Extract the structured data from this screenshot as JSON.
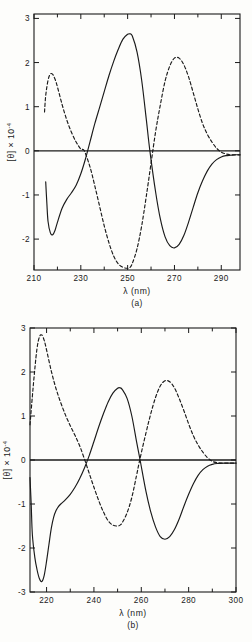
{
  "figure": {
    "panels": [
      {
        "id": "a",
        "caption": "(a)",
        "xlabel": "λ (nm)",
        "ylabel_main": "[θ] × 10",
        "ylabel_exp": "-4",
        "xticks": [
          "210",
          "230",
          "250",
          "270",
          "290"
        ],
        "yticks": [
          "3",
          "2",
          "1",
          "0",
          "-1",
          "-2"
        ]
      },
      {
        "id": "b",
        "caption": "(b)",
        "xlabel": "λ (nm)",
        "ylabel_main": "[θ] × 10",
        "ylabel_exp": "-4",
        "xticks": [
          "220",
          "240",
          "260",
          "280",
          "300"
        ],
        "yticks": [
          "3",
          "2",
          "1",
          "0",
          "-1",
          "-2",
          "-3"
        ]
      }
    ]
  },
  "chart_data": [
    {
      "type": "line",
      "title": "(a)",
      "xlabel": "λ (nm)",
      "ylabel": "[θ] × 10^-4",
      "xlim": [
        210,
        298
      ],
      "ylim": [
        -2.7,
        3.1
      ],
      "xticks": [
        210,
        230,
        250,
        270,
        290
      ],
      "yticks": [
        3,
        2,
        1,
        0,
        -1,
        -2
      ],
      "minor_tick_interval": 10,
      "grid": false,
      "legend": "none",
      "series": [
        {
          "name": "solid-curve",
          "style": "solid",
          "x": [
            215,
            215.5,
            216,
            217,
            218,
            219,
            220,
            222,
            224,
            226,
            228,
            230,
            232,
            234,
            236,
            238,
            240,
            242,
            244,
            246,
            248,
            250,
            251,
            252,
            254,
            256,
            258,
            259.5,
            262,
            264,
            266,
            268,
            270,
            272,
            274,
            276,
            278,
            280,
            282,
            284,
            286,
            288,
            290,
            292,
            294,
            296,
            298
          ],
          "y": [
            -0.7,
            -1.2,
            -1.6,
            -1.86,
            -1.9,
            -1.8,
            -1.62,
            -1.3,
            -1.1,
            -0.95,
            -0.78,
            -0.52,
            -0.18,
            0.22,
            0.62,
            0.98,
            1.34,
            1.7,
            2.02,
            2.3,
            2.53,
            2.64,
            2.65,
            2.6,
            2.24,
            1.6,
            0.7,
            0.0,
            -0.95,
            -1.55,
            -1.95,
            -2.15,
            -2.2,
            -2.12,
            -1.92,
            -1.62,
            -1.28,
            -0.95,
            -0.68,
            -0.46,
            -0.3,
            -0.2,
            -0.14,
            -0.11,
            -0.1,
            -0.09,
            -0.09
          ]
        },
        {
          "name": "dashed-curve",
          "style": "dashed",
          "x": [
            214.5,
            215,
            216,
            217,
            218,
            219,
            220,
            222,
            224,
            226,
            228,
            230,
            231.5,
            234,
            236,
            238,
            240,
            242,
            244,
            246,
            248,
            250,
            251,
            252,
            254,
            256,
            258,
            260,
            262,
            264,
            266,
            268,
            270,
            272,
            274,
            276,
            278,
            280,
            282,
            284,
            286,
            288,
            290,
            292,
            294,
            296,
            298
          ],
          "y": [
            0.88,
            1.25,
            1.6,
            1.74,
            1.73,
            1.62,
            1.45,
            1.05,
            0.7,
            0.42,
            0.2,
            0.04,
            0.0,
            -0.38,
            -0.8,
            -1.25,
            -1.7,
            -2.08,
            -2.38,
            -2.56,
            -2.64,
            -2.66,
            -2.64,
            -2.55,
            -2.22,
            -1.7,
            -1.02,
            -0.28,
            0.45,
            1.05,
            1.58,
            1.92,
            2.1,
            2.1,
            1.95,
            1.68,
            1.32,
            0.95,
            0.62,
            0.38,
            0.2,
            0.06,
            -0.03,
            -0.07,
            -0.09,
            -0.09,
            -0.09
          ]
        }
      ]
    },
    {
      "type": "line",
      "title": "(b)",
      "xlabel": "λ (nm)",
      "ylabel": "[θ] × 10^-4",
      "xlim": [
        213,
        300
      ],
      "ylim": [
        -3,
        3
      ],
      "xticks": [
        220,
        240,
        260,
        280,
        300
      ],
      "yticks": [
        3,
        2,
        1,
        0,
        -1,
        -2,
        -3
      ],
      "minor_tick_interval": 10,
      "grid": false,
      "legend": "none",
      "series": [
        {
          "name": "solid-curve",
          "style": "solid",
          "x": [
            213,
            213.5,
            214,
            215,
            216,
            217,
            218,
            219,
            220,
            221,
            222,
            223,
            224,
            225,
            226,
            228,
            230,
            232,
            234,
            236,
            238,
            240,
            242,
            244,
            246,
            248,
            250,
            251,
            252,
            254,
            256,
            258,
            259.5,
            262,
            264,
            266,
            268,
            270,
            272,
            274,
            276,
            278,
            280,
            282,
            284,
            286,
            288,
            290,
            292,
            295,
            298,
            300
          ],
          "y": [
            -0.4,
            -1.0,
            -1.7,
            -2.2,
            -2.5,
            -2.7,
            -2.76,
            -2.62,
            -2.3,
            -1.92,
            -1.55,
            -1.3,
            -1.15,
            -1.06,
            -1.0,
            -0.9,
            -0.78,
            -0.62,
            -0.42,
            -0.18,
            0.1,
            0.42,
            0.75,
            1.05,
            1.32,
            1.52,
            1.63,
            1.64,
            1.6,
            1.4,
            1.0,
            0.42,
            0.0,
            -0.72,
            -1.18,
            -1.52,
            -1.74,
            -1.8,
            -1.74,
            -1.58,
            -1.34,
            -1.05,
            -0.78,
            -0.54,
            -0.35,
            -0.22,
            -0.14,
            -0.1,
            -0.08,
            -0.07,
            -0.07,
            -0.07
          ]
        },
        {
          "name": "dashed-curve",
          "style": "dashed",
          "x": [
            213,
            214,
            215,
            216,
            217,
            218,
            219,
            220,
            222,
            224,
            226,
            228,
            230,
            232,
            234,
            236,
            238,
            240,
            242,
            244,
            246,
            248,
            250,
            251,
            252,
            254,
            256,
            258,
            259.5,
            262,
            264,
            266,
            268,
            270,
            272,
            274,
            276,
            278,
            280,
            282,
            284,
            286,
            288,
            290,
            292,
            295,
            298,
            300
          ],
          "y": [
            0.8,
            1.45,
            2.05,
            2.55,
            2.8,
            2.84,
            2.72,
            2.5,
            2.02,
            1.62,
            1.3,
            1.02,
            0.78,
            0.56,
            0.32,
            0.02,
            -0.3,
            -0.62,
            -0.92,
            -1.18,
            -1.38,
            -1.48,
            -1.5,
            -1.48,
            -1.42,
            -1.2,
            -0.85,
            -0.35,
            0.04,
            0.62,
            1.05,
            1.42,
            1.68,
            1.8,
            1.78,
            1.64,
            1.4,
            1.12,
            0.82,
            0.55,
            0.34,
            0.18,
            0.05,
            -0.03,
            -0.06,
            -0.07,
            -0.07,
            -0.07
          ]
        }
      ]
    }
  ]
}
